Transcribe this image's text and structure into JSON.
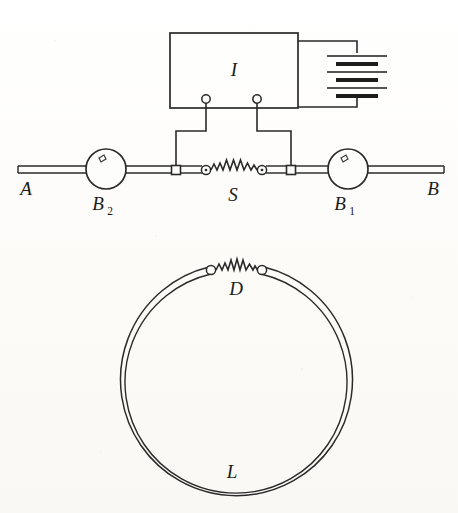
{
  "figure": {
    "background_color": "#fdfdfb",
    "ink_color": "#2a2a2a"
  },
  "labels": {
    "coil_box": "I",
    "line_left_end": "A",
    "line_right_end": "B",
    "instrument_left": "B",
    "instrument_left_sub": "2",
    "instrument_right": "B",
    "instrument_right_sub": "1",
    "spark_gap_line": "S",
    "spark_gap_loop": "D",
    "loop": "L"
  },
  "top_circuit": {
    "name": "induction-coil-circuit",
    "coil_box": {
      "label": "I",
      "x": 170,
      "y": 33,
      "width": 128,
      "height": 75,
      "terminals": [
        {
          "name": "terminal-left",
          "cx": 206,
          "cy": 99,
          "r": 4.2
        },
        {
          "name": "terminal-right",
          "cx": 257,
          "cy": 99,
          "r": 4.2
        }
      ]
    },
    "battery": {
      "name": "battery-stack",
      "cells": 3,
      "plates": [
        {
          "type": "long",
          "x1": 327,
          "x2": 387,
          "y": 56
        },
        {
          "type": "short",
          "x1": 336,
          "x2": 378,
          "y": 64
        },
        {
          "type": "long",
          "x1": 327,
          "x2": 387,
          "y": 72
        },
        {
          "type": "short",
          "x1": 336,
          "x2": 378,
          "y": 80
        },
        {
          "type": "long",
          "x1": 327,
          "x2": 387,
          "y": 88
        },
        {
          "type": "short",
          "x1": 336,
          "x2": 378,
          "y": 96
        }
      ],
      "top_lead_y": 41,
      "bottom_lead_y": 107
    },
    "main_line": {
      "name": "main-horizontal-conductor",
      "y": 170,
      "x_start": 18,
      "x_end": 444,
      "style": "double-line"
    },
    "instruments": [
      {
        "name": "instrument-B2",
        "cx": 106,
        "cy": 169,
        "r": 20,
        "label": "B",
        "sub": "2"
      },
      {
        "name": "instrument-B1",
        "cx": 348,
        "cy": 169,
        "r": 20,
        "label": "B",
        "sub": "1"
      }
    ],
    "connector_blocks": [
      {
        "name": "connector-block-left",
        "cx": 176,
        "cy": 170,
        "size": 9
      },
      {
        "name": "connector-block-right",
        "cx": 291,
        "cy": 170,
        "size": 9
      }
    ],
    "spark_gap": {
      "name": "spark-gap-S",
      "label": "S",
      "left_node": {
        "cx": 206,
        "cy": 170,
        "r": 4.5
      },
      "right_node": {
        "cx": 262,
        "cy": 170,
        "r": 4.5
      }
    },
    "lead_routing": {
      "left": {
        "from_terminal_x": 206,
        "drop_y": 131,
        "run_to_x": 176,
        "down_to_y": 166
      },
      "right": {
        "from_terminal_x": 257,
        "drop_y": 131,
        "run_to_x": 291,
        "down_to_y": 166
      }
    }
  },
  "bottom_circuit": {
    "name": "resonant-loop",
    "loop": {
      "name": "loop-L",
      "label": "L",
      "cx": 237,
      "cy": 384,
      "r_outer": 116,
      "r_inner": 112,
      "style": "double-line"
    },
    "spark_gap": {
      "name": "spark-gap-D",
      "label": "D",
      "left_node": {
        "cx": 211,
        "cy": 270,
        "r": 4.5
      },
      "right_node": {
        "cx": 262,
        "cy": 270,
        "r": 4.5
      }
    }
  }
}
